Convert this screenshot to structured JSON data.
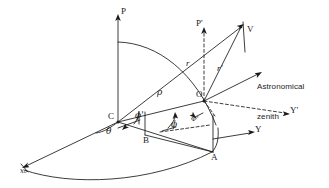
{
  "figure": {
    "type": "geodetic-coordinate-diagram",
    "ink_color": "#1a1a1a",
    "background_color": "#ffffff"
  },
  "labels": {
    "axis_P": "P",
    "axis_P_prime": "P'",
    "axis_Y": "Y",
    "axis_Y_prime": "Y'",
    "axis_x0": "x₀",
    "point_C": "C",
    "point_O": "O",
    "point_A": "A",
    "point_B": "B",
    "point_V": "V",
    "radius_rho": "ρ",
    "radius_r": "r",
    "radius_r_prime": "r'",
    "angle_theta": "θ",
    "angle_phi": "ϕ",
    "angle_phi_prime": "ϕ'",
    "angle_cap_phi_prime": "Φ'",
    "zenith_line1": "Astronomical",
    "zenith_line2": "zenith"
  }
}
